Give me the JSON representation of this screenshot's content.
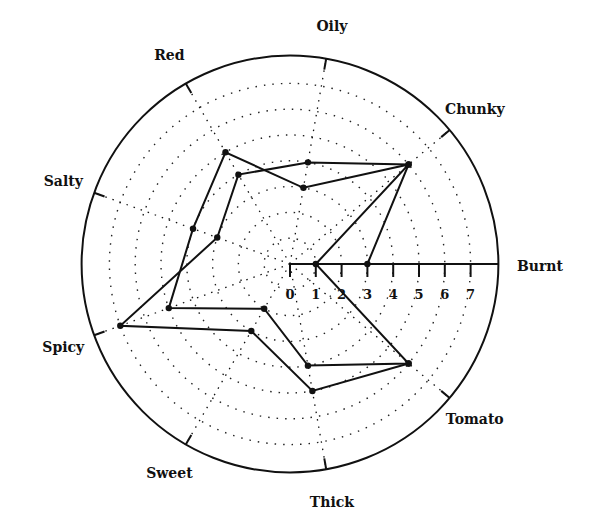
{
  "chart_data": {
    "type": "radar",
    "title": "",
    "axes": [
      "Burnt",
      "Chunky",
      "Oily",
      "Red",
      "Salty",
      "Spicy",
      "Sweet",
      "Thick",
      "Tomato"
    ],
    "axis_angles_deg": [
      0,
      40,
      80,
      120,
      160,
      200,
      240,
      280,
      320
    ],
    "scale": {
      "min": 0,
      "max": 8,
      "tick_labels": [
        "0",
        "1",
        "2",
        "3",
        "4",
        "5",
        "6",
        "7"
      ],
      "rings": [
        1,
        2,
        3,
        4,
        5,
        6,
        7
      ],
      "ring_style": "dotted",
      "outer_ring": 8
    },
    "series": [
      {
        "name": "Series A",
        "values": {
          "Burnt": 3,
          "Chunky": 6,
          "Oily": 4,
          "Red": 4,
          "Salty": 3,
          "Spicy": 7,
          "Sweet": 3,
          "Thick": 5,
          "Tomato": 6
        },
        "closed": false
      },
      {
        "name": "Series B",
        "values": {
          "Burnt": 1,
          "Chunky": 6,
          "Oily": 3,
          "Red": 5,
          "Salty": 4,
          "Spicy": 5,
          "Sweet": 2,
          "Thick": 4,
          "Tomato": 6
        },
        "closed": true
      }
    ],
    "legend": null
  },
  "style": {
    "line_color": "#111111",
    "grid_color": "#222222",
    "background": "#ffffff"
  }
}
